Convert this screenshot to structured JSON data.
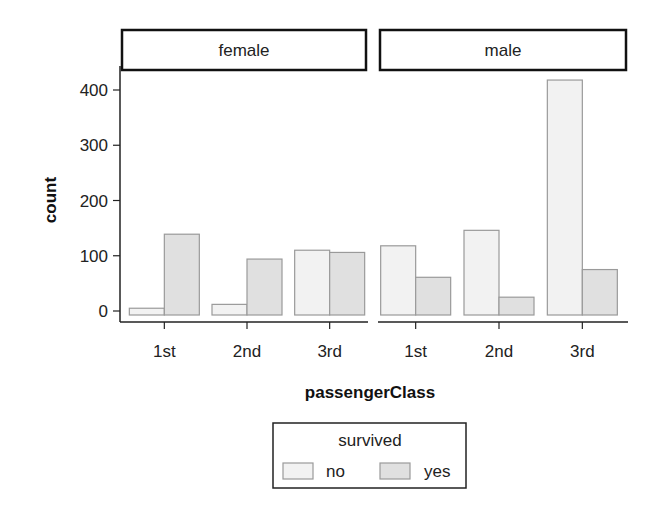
{
  "chart_data": {
    "type": "bar",
    "title": "",
    "xlabel": "passengerClass",
    "ylabel": "count",
    "ylim": [
      0,
      420
    ],
    "yticks": [
      0,
      100,
      200,
      300,
      400
    ],
    "categories": [
      "1st",
      "2nd",
      "3rd"
    ],
    "facets": [
      {
        "label": "female",
        "series": [
          {
            "name": "no",
            "values": [
              5,
              12,
              110
            ]
          },
          {
            "name": "yes",
            "values": [
              139,
              94,
              106
            ]
          }
        ]
      },
      {
        "label": "male",
        "series": [
          {
            "name": "no",
            "values": [
              118,
              146,
              418
            ]
          },
          {
            "name": "yes",
            "values": [
              61,
              25,
              75
            ]
          }
        ]
      }
    ],
    "legend": {
      "title": "survived",
      "entries": [
        "no",
        "yes"
      ],
      "position": "bottom"
    },
    "colors": {
      "no": "#f2f2f2",
      "yes": "#e0e0e0",
      "bar_border": "#9a9a9a"
    },
    "grid": false
  }
}
